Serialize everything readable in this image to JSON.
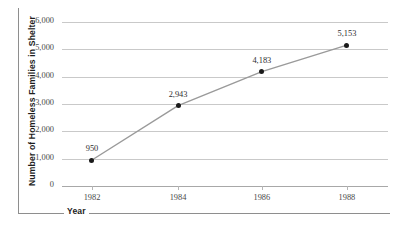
{
  "chart_data": {
    "type": "line",
    "title": "",
    "xlabel": "Year",
    "ylabel": "Number of Homeless Families in Shelter",
    "x": [
      1982,
      1984,
      1986,
      1988
    ],
    "categories": [
      "1982",
      "1984",
      "1986",
      "1988"
    ],
    "values": [
      950,
      2943,
      4183,
      5153
    ],
    "point_labels": [
      "950",
      "2,943",
      "4,183",
      "5,153"
    ],
    "series": [
      {
        "name": "Number of Homeless Families in Shelter",
        "values": [
          950,
          2943,
          4183,
          5153
        ]
      }
    ],
    "ylim": [
      0,
      6000
    ],
    "ytick_values": [
      0,
      1000,
      2000,
      3000,
      4000,
      5000,
      6000
    ],
    "ytick_labels": [
      "0",
      "1,000",
      "2,000",
      "3,000",
      "4,000",
      "5,000",
      "6,000"
    ],
    "xtick_labels": [
      "1982",
      "1984",
      "1986",
      "1988"
    ],
    "grid": "horizontal",
    "legend": "none",
    "line_color": "#9a9a9a",
    "marker_color": "#1a1a1a",
    "gridline_color": "#c9c9c9",
    "background_color": "#ffffff"
  }
}
